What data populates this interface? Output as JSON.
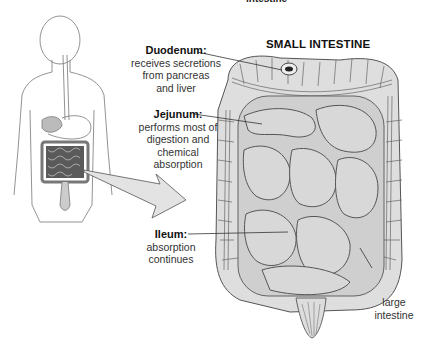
{
  "header": {
    "cut_off_text": "intestine",
    "title": "SMALL INTESTINE"
  },
  "labels": {
    "duodenum": {
      "name": "Duodenum:",
      "lines": [
        "receives secretions",
        "from pancreas",
        "and liver"
      ]
    },
    "jejunum": {
      "name": "Jejunum:",
      "lines": [
        "performs most of",
        "digestion and",
        "chemical",
        "absorption"
      ]
    },
    "ileum": {
      "name": "Ileum:",
      "lines": [
        "absorption",
        "continues"
      ]
    },
    "large_intestine": {
      "lines": [
        "large",
        "intestine"
      ]
    }
  },
  "colors": {
    "organ_fill": "#d9d9d9",
    "organ_stroke": "#555555",
    "small_intestine_icon": "#5a5a5a",
    "text": "#222222"
  }
}
